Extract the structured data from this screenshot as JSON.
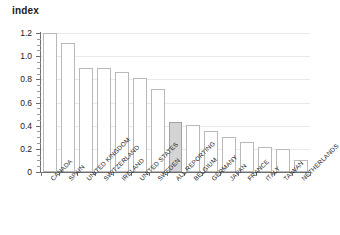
{
  "chart_data": {
    "type": "bar",
    "title": "index",
    "xlabel": "",
    "ylabel": "index",
    "ylim": [
      0,
      1.2
    ],
    "yticks": [
      "0",
      "0.2",
      "0.4",
      "0.6",
      "0.8",
      "1.0",
      "1.2"
    ],
    "grid": true,
    "legend": "none",
    "highlight_category": "ALL REPORTING",
    "highlight_color": "#d4d4d4",
    "bar_color": "#ffffff",
    "bar_edge_color": "#b9b9b9",
    "categories": [
      "CANADA",
      "SPAIN",
      "UNITED KINGDOM",
      "SWITZERLAND",
      "IRELAND",
      "UNITED STATES",
      "SWEDEN",
      "ALL REPORTING",
      "BELGIUM",
      "GERMANY",
      "JAPAN",
      "FRANCE",
      "ITALY",
      "TAIWAN",
      "NETHERLANDS"
    ],
    "values": [
      1.2,
      1.11,
      0.9,
      0.9,
      0.86,
      0.81,
      0.72,
      0.43,
      0.41,
      0.35,
      0.3,
      0.26,
      0.22,
      0.2,
      0.1
    ]
  },
  "axis": {
    "y_title": "index"
  }
}
